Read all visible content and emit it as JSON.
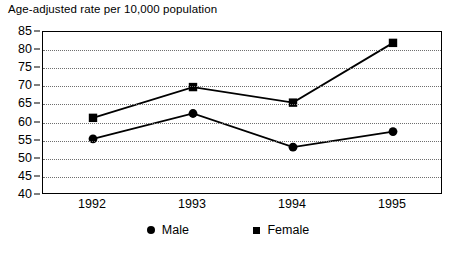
{
  "chart_data": {
    "type": "line",
    "title": "Age-adjusted rate per 10,000 population",
    "xlabel": "",
    "ylabel": "",
    "categories": [
      "1992",
      "1993",
      "1994",
      "1995"
    ],
    "x": [
      1992,
      1993,
      1994,
      1995
    ],
    "ylim": [
      40,
      85
    ],
    "yticks": [
      40,
      45,
      50,
      55,
      60,
      65,
      70,
      75,
      80,
      85
    ],
    "ytick_labels": [
      "40",
      "45",
      "50",
      "55",
      "60",
      "65",
      "70",
      "75",
      "80",
      "85"
    ],
    "grid": "horizontal-dotted",
    "legend_position": "bottom-center",
    "series": [
      {
        "name": "Male",
        "marker": "circle",
        "color": "#000000",
        "values": [
          55.5,
          62.5,
          53.2,
          57.5
        ]
      },
      {
        "name": "Female",
        "marker": "square",
        "color": "#000000",
        "values": [
          61.3,
          69.8,
          65.5,
          82.0
        ]
      }
    ]
  },
  "legend": {
    "entries": [
      {
        "label": "Male",
        "marker_icon": "filled-circle-marker"
      },
      {
        "label": "Female",
        "marker_icon": "filled-square-marker"
      }
    ]
  },
  "colors": {
    "line": "#000000",
    "grid": "#6e6e6e",
    "axis": "#000000",
    "background": "#ffffff"
  }
}
